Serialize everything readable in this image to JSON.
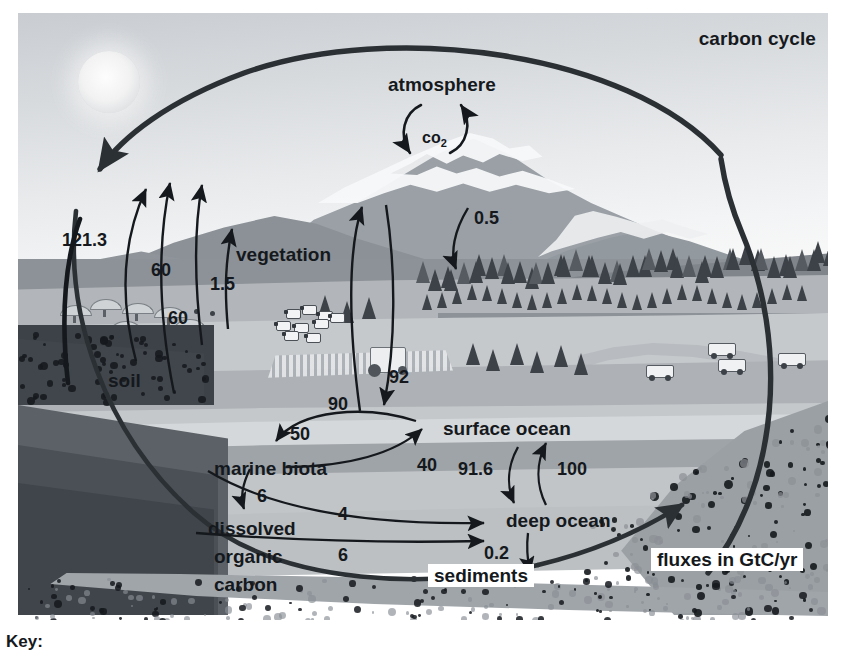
{
  "figure": {
    "title": "carbon cycle",
    "units_note": "fluxes in GtC/yr",
    "key_label": "Key:"
  },
  "reservoirs": [
    {
      "id": "atmosphere",
      "label": "atmosphere"
    },
    {
      "id": "co2",
      "label": "CO2"
    },
    {
      "id": "vegetation",
      "label": "vegetation"
    },
    {
      "id": "soil",
      "label": "soil"
    },
    {
      "id": "surface-ocean",
      "label": "surface ocean"
    },
    {
      "id": "marine-biota",
      "label": "marine biota"
    },
    {
      "id": "deep-ocean",
      "label": "deep ocean"
    },
    {
      "id": "dissolved-organic-carbon",
      "label_line1": "dissolved",
      "label_line2": "organic",
      "label_line3": "carbon"
    },
    {
      "id": "sediments",
      "label": "sediments"
    }
  ],
  "fluxes": [
    {
      "id": "fossil-fuel-emissions",
      "value": "121.3"
    },
    {
      "id": "vegetation-respiration",
      "value": "60"
    },
    {
      "id": "land-use-change",
      "value": "1.5"
    },
    {
      "id": "soil-respiration",
      "value": "60"
    },
    {
      "id": "weathering-deposition",
      "value": "0.5"
    },
    {
      "id": "ocean-to-atmosphere",
      "value": "90"
    },
    {
      "id": "atmosphere-to-ocean",
      "value": "92"
    },
    {
      "id": "surface-to-marine-biota",
      "value": "50"
    },
    {
      "id": "marine-biota-to-surface",
      "value": "40"
    },
    {
      "id": "surface-to-deep-ocean",
      "value": "91.6"
    },
    {
      "id": "deep-to-surface-ocean",
      "value": "100"
    },
    {
      "id": "marine-biota-to-doc",
      "value": "6"
    },
    {
      "id": "marine-biota-to-deep-ocean",
      "value": "4"
    },
    {
      "id": "doc-to-deep-ocean",
      "value": "6"
    },
    {
      "id": "deep-ocean-to-sediments",
      "value": "0.2"
    }
  ],
  "chart_data": {
    "type": "diagram",
    "title": "carbon cycle",
    "units": "GtC/yr",
    "nodes": [
      "atmosphere",
      "vegetation",
      "soil",
      "surface ocean",
      "marine biota",
      "deep ocean",
      "dissolved organic carbon",
      "sediments"
    ],
    "edges": [
      {
        "from": "fossil fuels",
        "to": "atmosphere",
        "value": 121.3
      },
      {
        "from": "vegetation",
        "to": "atmosphere",
        "value": 60
      },
      {
        "from": "land use",
        "to": "atmosphere",
        "value": 1.5
      },
      {
        "from": "soil",
        "to": "atmosphere",
        "value": 60
      },
      {
        "from": "atmosphere",
        "to": "vegetation",
        "value": 0.5
      },
      {
        "from": "surface ocean",
        "to": "atmosphere",
        "value": 90
      },
      {
        "from": "atmosphere",
        "to": "surface ocean",
        "value": 92
      },
      {
        "from": "surface ocean",
        "to": "marine biota",
        "value": 50
      },
      {
        "from": "marine biota",
        "to": "surface ocean",
        "value": 40
      },
      {
        "from": "surface ocean",
        "to": "deep ocean",
        "value": 91.6
      },
      {
        "from": "deep ocean",
        "to": "surface ocean",
        "value": 100
      },
      {
        "from": "marine biota",
        "to": "dissolved organic carbon",
        "value": 6
      },
      {
        "from": "marine biota",
        "to": "deep ocean",
        "value": 4
      },
      {
        "from": "dissolved organic carbon",
        "to": "deep ocean",
        "value": 6
      },
      {
        "from": "deep ocean",
        "to": "sediments",
        "value": 0.2
      }
    ]
  },
  "colors": {
    "ink": "#15191d",
    "sky": "#e3e5e7",
    "land": "#aeb2b6",
    "ocean": "#c2c5c8",
    "bedrock": "#9ba0a5"
  }
}
